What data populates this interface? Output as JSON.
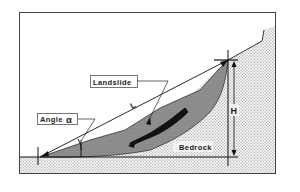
{
  "diagram": {
    "labels": {
      "landslide": "Landslide",
      "angle": "Angle",
      "angle_symbol": "α",
      "length": "L",
      "height": "H",
      "bedrock": "Bedrock"
    },
    "colors": {
      "frame": "#444444",
      "line": "#111111",
      "bedrock_fill": "#d9d9d9",
      "landslide_fill": "#9a9a9a",
      "deposit_streak": "#111111",
      "background": "#ffffff"
    }
  }
}
